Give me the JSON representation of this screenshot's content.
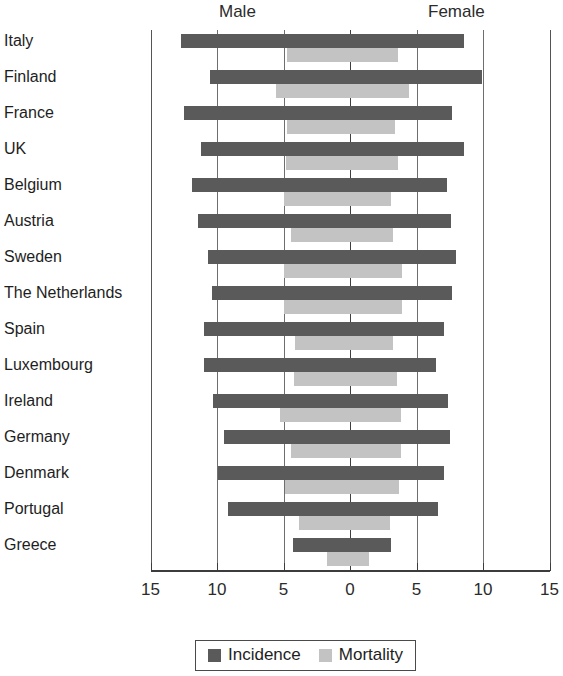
{
  "chart_data": {
    "type": "bar",
    "subtype": "back-to-back population pyramid",
    "title": "",
    "xlabel": "",
    "ylabel": "",
    "left_side_label": "Male",
    "right_side_label": "Female",
    "categories": [
      "Italy",
      "Finland",
      "France",
      "UK",
      "Belgium",
      "Austria",
      "Sweden",
      "The Netherlands",
      "Spain",
      "Luxembourg",
      "Ireland",
      "Germany",
      "Denmark",
      "Portugal",
      "Greece"
    ],
    "series": [
      {
        "name": "Incidence",
        "color": "#5a5a5a",
        "male": [
          12.7,
          10.5,
          12.5,
          11.2,
          11.9,
          11.4,
          10.7,
          10.4,
          11.0,
          11.0,
          10.3,
          9.5,
          9.9,
          9.2,
          4.3
        ],
        "female": [
          8.6,
          9.9,
          7.7,
          8.6,
          7.3,
          7.6,
          8.0,
          7.7,
          7.1,
          6.5,
          7.4,
          7.5,
          7.1,
          6.6,
          3.1
        ]
      },
      {
        "name": "Mortality",
        "color": "#c3c3c3",
        "male": [
          4.7,
          5.6,
          4.7,
          4.8,
          5.0,
          4.4,
          5.0,
          5.0,
          4.1,
          4.2,
          5.3,
          4.4,
          4.9,
          3.8,
          1.7
        ],
        "female": [
          3.6,
          4.4,
          3.4,
          3.6,
          3.1,
          3.2,
          3.9,
          3.9,
          3.2,
          3.5,
          3.8,
          3.8,
          3.7,
          3.0,
          1.4
        ]
      }
    ],
    "axis": {
      "ticks": [
        "15",
        "10",
        "5",
        "0",
        "5",
        "10",
        "15"
      ],
      "tick_values": [
        -15,
        -10,
        -5,
        0,
        5,
        10,
        15
      ],
      "min": -15,
      "max": 15,
      "grid": true
    },
    "legend": {
      "position": "bottom",
      "entries": [
        {
          "label": "Incidence",
          "color": "#5a5a5a",
          "icon": "square-swatch-dark"
        },
        {
          "label": "Mortality",
          "color": "#c3c3c3",
          "icon": "square-swatch-light"
        }
      ]
    }
  }
}
